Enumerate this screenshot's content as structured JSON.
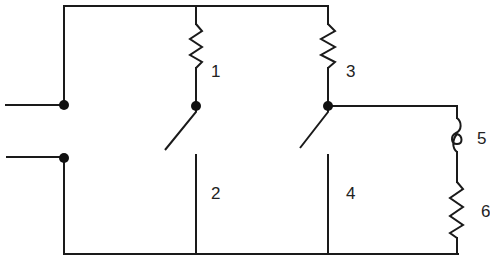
{
  "diagram": {
    "title": "",
    "type": "circuit-schematic",
    "colors": {
      "line": "#1a1a1a",
      "background": "#ffffff"
    },
    "labels": {
      "r1": "1",
      "contact2": "2",
      "r3": "3",
      "contact4": "4",
      "coil5": "5",
      "r6": "6"
    },
    "components": [
      {
        "id": "1",
        "kind": "resistor",
        "branch": "left-switch-branch"
      },
      {
        "id": "2",
        "kind": "switch-contact",
        "branch": "left-switch-branch"
      },
      {
        "id": "3",
        "kind": "resistor",
        "branch": "middle-switch-branch"
      },
      {
        "id": "4",
        "kind": "switch-contact",
        "branch": "middle-switch-branch"
      },
      {
        "id": "5",
        "kind": "coil/lamp-filament",
        "branch": "right-load-branch"
      },
      {
        "id": "6",
        "kind": "resistor",
        "branch": "right-load-branch"
      }
    ],
    "terminals": 2,
    "junction_dots": 4
  }
}
